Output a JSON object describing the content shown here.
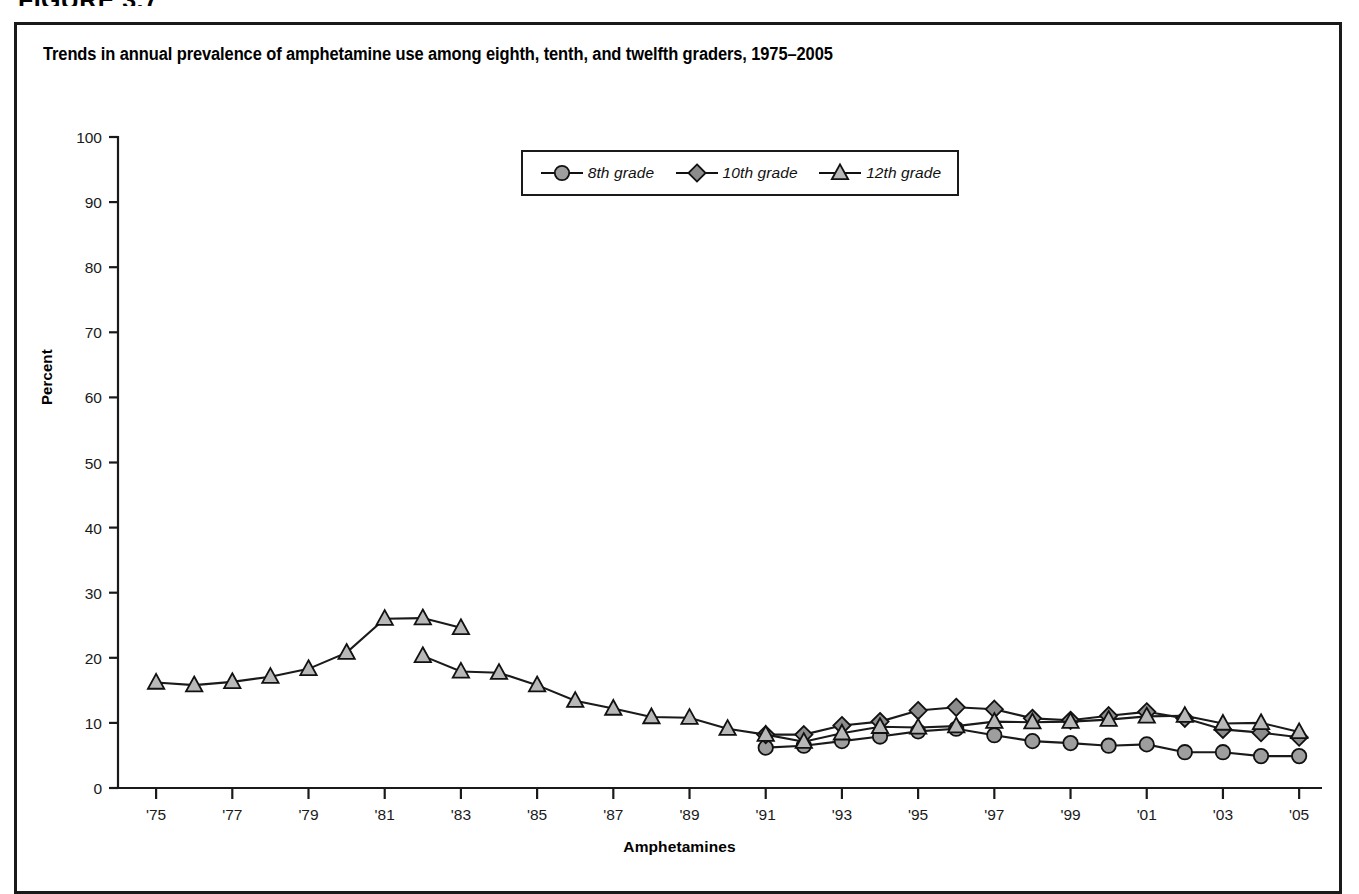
{
  "figure": {
    "heading": "FIGURE 3.7",
    "title": "Trends in annual prevalence of amphetamine use among eighth, tenth, and twelfth graders, 1975–2005"
  },
  "axes": {
    "ylabel": "Percent",
    "xlabel": "Amphetamines",
    "y_ticks": [
      "0",
      "10",
      "20",
      "30",
      "40",
      "50",
      "60",
      "70",
      "80",
      "90",
      "100"
    ],
    "x_ticks": [
      "'75",
      "'77",
      "'79",
      "'81",
      "'83",
      "'85",
      "'87",
      "'89",
      "'91",
      "'93",
      "'95",
      "'97",
      "'99",
      "'01",
      "'03",
      "'05"
    ]
  },
  "legend": {
    "items": [
      {
        "label": "8th grade",
        "marker": "circle-marker",
        "color": "#9e9e9e"
      },
      {
        "label": "10th grade",
        "marker": "diamond-marker",
        "color": "#8c8c8c"
      },
      {
        "label": "12th grade",
        "marker": "triangle-marker",
        "color": "#b3b3b3"
      }
    ]
  },
  "colors": {
    "line": "#1a1a1a",
    "marker_fill_circle": "#9e9e9e",
    "marker_fill_diamond": "#8c8c8c",
    "marker_fill_triangle": "#b8b8b8",
    "border": "#1a1a1a",
    "background": "#ffffff"
  },
  "chart_data": {
    "type": "line",
    "title": "Trends in annual prevalence of amphetamine use among eighth, tenth, and twelfth graders, 1975–2005",
    "xlabel": "Amphetamines",
    "ylabel": "Percent",
    "xlim": [
      1974,
      2005.6
    ],
    "ylim": [
      0,
      100
    ],
    "grid": false,
    "legend_position": "top-center",
    "series": [
      {
        "name": "8th grade",
        "marker": "circle",
        "x": [
          1991,
          1992,
          1993,
          1994,
          1995,
          1996,
          1997,
          1998,
          1999,
          2000,
          2001,
          2002,
          2003,
          2004,
          2005
        ],
        "values": [
          6.2,
          6.5,
          7.2,
          7.9,
          8.7,
          9.1,
          8.1,
          7.2,
          6.9,
          6.5,
          6.7,
          5.5,
          5.5,
          4.9,
          4.9
        ]
      },
      {
        "name": "10th grade",
        "marker": "diamond",
        "x": [
          1991,
          1992,
          1993,
          1994,
          1995,
          1996,
          1997,
          1998,
          1999,
          2000,
          2001,
          2002,
          2003,
          2004,
          2005
        ],
        "values": [
          8.2,
          8.2,
          9.6,
          10.2,
          11.9,
          12.4,
          12.1,
          10.7,
          10.4,
          11.1,
          11.7,
          10.7,
          9.0,
          8.5,
          7.8
        ]
      },
      {
        "name": "12th grade (original series)",
        "marker": "triangle",
        "x": [
          1975,
          1976,
          1977,
          1978,
          1979,
          1980,
          1981,
          1982,
          1983
        ],
        "values": [
          16.2,
          15.8,
          16.3,
          17.1,
          18.3,
          20.8,
          26.0,
          26.1,
          24.6
        ]
      },
      {
        "name": "12th grade (revised series)",
        "marker": "triangle",
        "x": [
          1982,
          1983,
          1984,
          1985,
          1986,
          1987,
          1988,
          1989,
          1990,
          1991,
          1992,
          1993,
          1994,
          1995,
          1996,
          1997,
          1998,
          1999,
          2000,
          2001,
          2002,
          2003,
          2004,
          2005
        ],
        "values": [
          20.3,
          17.9,
          17.7,
          15.8,
          13.4,
          12.2,
          10.9,
          10.8,
          9.1,
          8.2,
          7.1,
          8.4,
          9.4,
          9.3,
          9.5,
          10.2,
          10.1,
          10.2,
          10.5,
          11.0,
          11.1,
          9.9,
          10.0,
          8.6
        ]
      }
    ]
  }
}
